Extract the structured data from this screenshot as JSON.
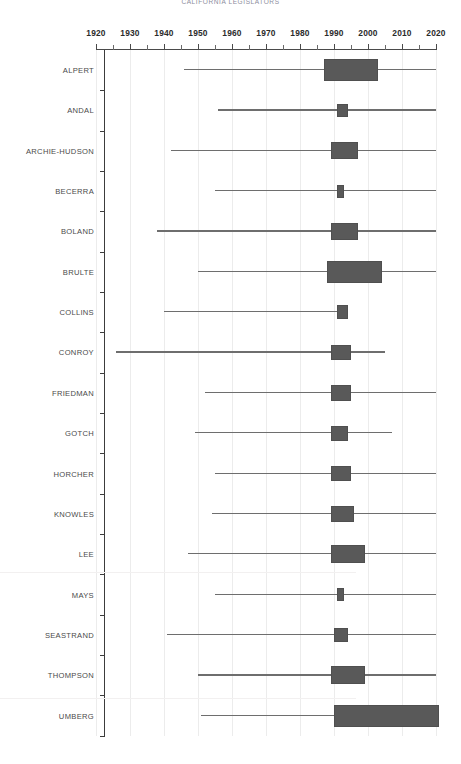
{
  "chart_data": {
    "type": "bar",
    "subtype": "box-whisker-horizontal",
    "title": "CALIFORNIA LEGISLATORS",
    "xlabel": "",
    "ylabel": "",
    "xlim": [
      1920,
      2021
    ],
    "grid": true,
    "legend": false,
    "orientation": "horizontal",
    "x_tick_labels": [
      "1920",
      "1930",
      "1940",
      "1950",
      "1960",
      "1970",
      "1980",
      "1990",
      "2000",
      "2010",
      "2020"
    ],
    "x_tick_values": [
      1920,
      1930,
      1940,
      1950,
      1960,
      1970,
      1980,
      1990,
      2000,
      2010,
      2020
    ],
    "x_minor_tick_values": [
      1925,
      1935,
      1945,
      1955,
      1965,
      1975,
      1985,
      1995,
      2005,
      2015
    ],
    "categories": [
      "ALPERT",
      "ANDAL",
      "ARCHIE-HUDSON",
      "BECERRA",
      "BOLAND",
      "BRULTE",
      "COLLINS",
      "CONROY",
      "FRIEDMAN",
      "GOTCH",
      "HORCHER",
      "KNOWLES",
      "LEE",
      "MAYS",
      "SEASTRAND",
      "THOMPSON",
      "UMBERG"
    ],
    "boxes": [
      {
        "name": "ALPERT",
        "whisker_low": 1946,
        "q1": 1987,
        "q3": 2003,
        "whisker_high": 2020
      },
      {
        "name": "ANDAL",
        "whisker_low": 1956,
        "q1": 1991,
        "q3": 1994,
        "whisker_high": 2020
      },
      {
        "name": "ARCHIE-HUDSON",
        "whisker_low": 1942,
        "q1": 1989,
        "q3": 1997,
        "whisker_high": 2020
      },
      {
        "name": "BECERRA",
        "whisker_low": 1955,
        "q1": 1991,
        "q3": 1993,
        "whisker_high": 2020
      },
      {
        "name": "BOLAND",
        "whisker_low": 1938,
        "q1": 1989,
        "q3": 1997,
        "whisker_high": 2020
      },
      {
        "name": "BRULTE",
        "whisker_low": 1950,
        "q1": 1988,
        "q3": 2004,
        "whisker_high": 2020
      },
      {
        "name": "COLLINS",
        "whisker_low": 1940,
        "q1": 1991,
        "q3": 1994,
        "whisker_high": 1994
      },
      {
        "name": "CONROY",
        "whisker_low": 1926,
        "q1": 1989,
        "q3": 1995,
        "whisker_high": 2005
      },
      {
        "name": "FRIEDMAN",
        "whisker_low": 1952,
        "q1": 1989,
        "q3": 1995,
        "whisker_high": 2020
      },
      {
        "name": "GOTCH",
        "whisker_low": 1949,
        "q1": 1989,
        "q3": 1994,
        "whisker_high": 2007
      },
      {
        "name": "HORCHER",
        "whisker_low": 1955,
        "q1": 1989,
        "q3": 1995,
        "whisker_high": 2020
      },
      {
        "name": "KNOWLES",
        "whisker_low": 1954,
        "q1": 1989,
        "q3": 1996,
        "whisker_high": 2020
      },
      {
        "name": "LEE",
        "whisker_low": 1947,
        "q1": 1989,
        "q3": 1999,
        "whisker_high": 2020
      },
      {
        "name": "MAYS",
        "whisker_low": 1955,
        "q1": 1991,
        "q3": 1993,
        "whisker_high": 2020
      },
      {
        "name": "SEASTRAND",
        "whisker_low": 1941,
        "q1": 1990,
        "q3": 1994,
        "whisker_high": 2020
      },
      {
        "name": "THOMPSON",
        "whisker_low": 1950,
        "q1": 1989,
        "q3": 1999,
        "whisker_high": 2020
      },
      {
        "name": "UMBERG",
        "whisker_low": 1951,
        "q1": 1990,
        "q3": 2021,
        "whisker_high": 2021
      }
    ],
    "colors": {
      "box_fill": "#595959",
      "box_edge": "#4f4f4f",
      "whisker": "#6e6e6e",
      "axis": "#3c3c3c",
      "grid": "#ececec",
      "title": "#8c8c9c",
      "tick_label": "#2b2b2b",
      "category_label": "#4a4a4a",
      "background": "#ffffff"
    }
  }
}
